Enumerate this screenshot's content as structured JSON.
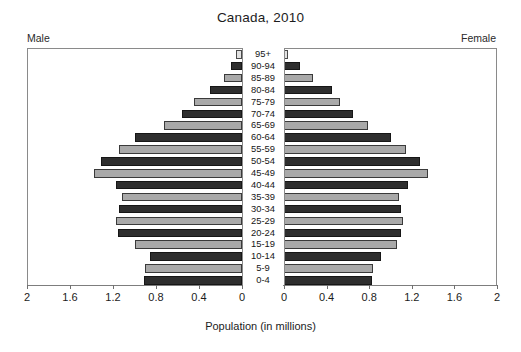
{
  "chart_data": {
    "type": "bar",
    "subtype": "population-pyramid",
    "title": "Canada, 2010",
    "xlabel": "Population (in millions)",
    "ylabel": "",
    "xlim": [
      0,
      2
    ],
    "grid": false,
    "left_label": "Male",
    "right_label": "Female",
    "tick_values": [
      2,
      1.6,
      1.2,
      0.8,
      0.4,
      0
    ],
    "left_tick_labels": [
      "2",
      "1.6",
      "1.2",
      "0.8",
      "0.4",
      "0"
    ],
    "right_tick_labels": [
      "0",
      "0.4",
      "0.8",
      "1.2",
      "1.6",
      "2"
    ],
    "categories": [
      "95+",
      "90-94",
      "85-89",
      "80-84",
      "75-79",
      "70-74",
      "65-69",
      "60-64",
      "55-59",
      "50-54",
      "45-49",
      "40-44",
      "35-39",
      "30-34",
      "25-29",
      "20-24",
      "15-19",
      "10-14",
      "5-9",
      "0-4"
    ],
    "series": [
      {
        "name": "Male",
        "side": "left",
        "values": [
          0.06,
          0.1,
          0.17,
          0.3,
          0.45,
          0.56,
          0.73,
          1.0,
          1.14,
          1.31,
          1.38,
          1.17,
          1.12,
          1.14,
          1.17,
          1.15,
          1.0,
          0.86,
          0.9,
          0.91
        ]
      },
      {
        "name": "Female",
        "side": "right",
        "values": [
          0.04,
          0.15,
          0.27,
          0.45,
          0.53,
          0.65,
          0.79,
          1.0,
          1.15,
          1.28,
          1.35,
          1.16,
          1.08,
          1.1,
          1.12,
          1.1,
          1.06,
          0.91,
          0.84,
          0.83
        ]
      }
    ],
    "colors": {
      "dark_bar": "#2e2e2e",
      "gray_bar": "#a9a9a9",
      "light_bar": "#e2e2e2",
      "axis": "#8a8a8a",
      "background": "#ffffff",
      "text": "#1a1a1a"
    },
    "bar_shading_pattern": [
      "lite",
      "dark",
      "gray",
      "dark",
      "gray",
      "dark",
      "gray",
      "dark",
      "gray",
      "dark",
      "gray",
      "dark",
      "gray",
      "dark",
      "gray",
      "dark",
      "gray",
      "dark",
      "gray",
      "dark"
    ]
  }
}
